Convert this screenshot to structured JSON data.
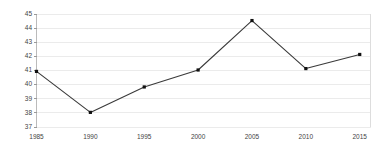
{
  "chart_data": {
    "type": "line",
    "title": "",
    "subtitle": "",
    "xlabel": "",
    "ylabel": "",
    "categories": [
      "1985",
      "1990",
      "1995",
      "2000",
      "2005",
      "2010",
      "2015"
    ],
    "x": [
      1985,
      1990,
      1995,
      2000,
      2005,
      2010,
      2015
    ],
    "values": [
      40.9,
      38.0,
      39.8,
      41.0,
      44.5,
      41.1,
      42.1
    ],
    "series": [
      {
        "name": "",
        "values": [
          40.9,
          38.0,
          39.8,
          41.0,
          44.5,
          41.1,
          42.1
        ]
      }
    ],
    "xlim": [
      1985,
      2016
    ],
    "ylim": [
      37,
      45
    ],
    "ytick_labels": [
      "37",
      "38",
      "39",
      "40",
      "41",
      "42",
      "43",
      "44",
      "45"
    ],
    "yticks": [
      37,
      38,
      39,
      40,
      41,
      42,
      43,
      44,
      45
    ],
    "xtick_labels": [
      "1985",
      "1990",
      "1995",
      "2000",
      "2005",
      "2010",
      "2015"
    ],
    "grid": "horizontal",
    "legend": "none",
    "colors": {
      "line": "#3a3a3a",
      "marker": "#111111",
      "gridline": "#ebebeb",
      "border": "#dddddd",
      "axis": "#bbbbbb",
      "text": "#444444",
      "background": "#ffffff"
    },
    "marker_style": "square"
  }
}
